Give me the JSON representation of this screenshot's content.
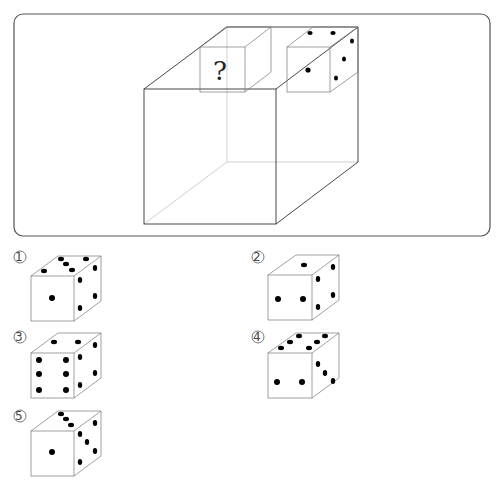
{
  "puzzle": {
    "question_mark": "?",
    "description": "Large transparent cube with two small dice on top; the left die face is unknown",
    "known_die": {
      "front": 1,
      "top": 4,
      "right": 3
    }
  },
  "options": [
    {
      "label": "①",
      "number": 1,
      "top": 5,
      "front": 1,
      "right": 4
    },
    {
      "label": "②",
      "number": 2,
      "top": 1,
      "front": 2,
      "right": 4
    },
    {
      "label": "③",
      "number": 3,
      "top": 2,
      "front": 6,
      "right": 4
    },
    {
      "label": "④",
      "number": 4,
      "top": 6,
      "front": 2,
      "right": 3
    },
    {
      "label": "⑤",
      "number": 5,
      "top": 3,
      "front": 1,
      "right": 5
    }
  ],
  "colors": {
    "stroke": "#333333",
    "hidden_edge": "#bbbbbb",
    "pip": "#000000",
    "background": "#ffffff"
  }
}
